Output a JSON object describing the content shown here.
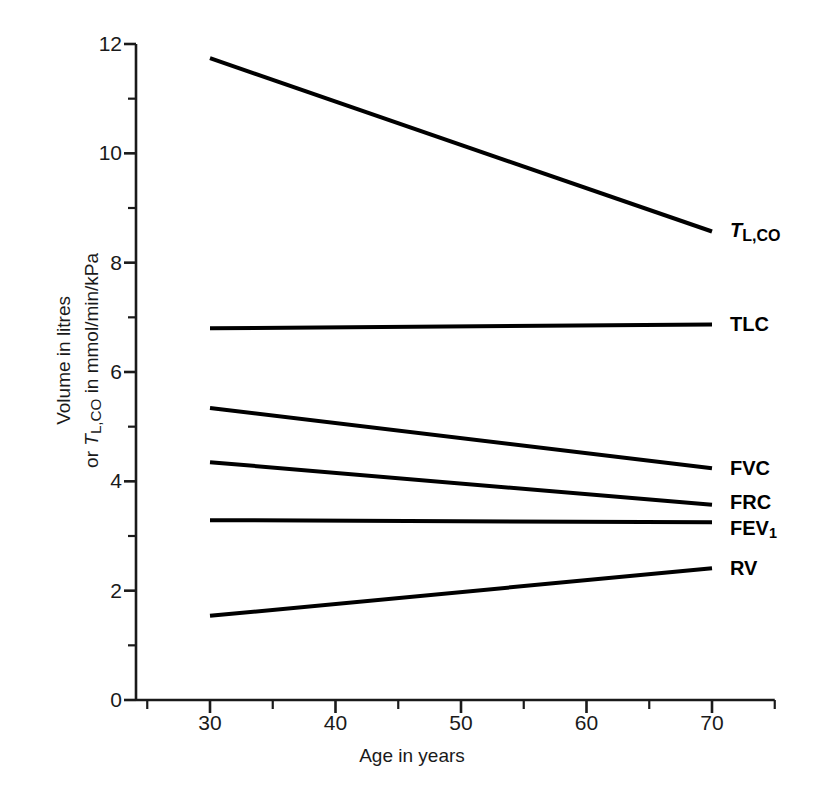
{
  "chart_data": {
    "type": "line",
    "title": "",
    "xlabel": "Age in years",
    "ylabel_line1": "Volume in litres",
    "ylabel_line2_prefix": "or ",
    "ylabel_line2_symbol_main": "T",
    "ylabel_line2_symbol_sub": "L,CO",
    "ylabel_line2_suffix": " in mmol/min/kPa",
    "x": [
      30,
      70
    ],
    "xlim": [
      25,
      75
    ],
    "ylim": [
      0,
      12
    ],
    "xticks_major": [
      30,
      40,
      50,
      60,
      70
    ],
    "xticks_minor": [
      25,
      35,
      45,
      55,
      65,
      75
    ],
    "yticks_major": [
      0,
      2,
      4,
      6,
      8,
      10,
      12
    ],
    "yticks_minor": [
      1,
      3,
      5,
      7,
      9,
      11
    ],
    "xtick_labels": [
      "30",
      "40",
      "50",
      "60",
      "70"
    ],
    "ytick_labels": [
      "0",
      "2",
      "4",
      "6",
      "8",
      "10",
      "12"
    ],
    "grid": false,
    "legend": "right-of-line-ends",
    "series": [
      {
        "name": "T_L,CO",
        "label_main": "T",
        "label_sub": "L,CO",
        "label_style": "bold-italic-smallcaps-sub",
        "values": [
          11.74,
          8.57
        ],
        "label_y": 8.57
      },
      {
        "name": "TLC",
        "label_main": "TLC",
        "label_sub": "",
        "label_style": "bold",
        "values": [
          6.8,
          6.87
        ],
        "label_y": 6.87
      },
      {
        "name": "FVC",
        "label_main": "FVC",
        "label_sub": "",
        "label_style": "bold",
        "values": [
          5.34,
          4.24
        ],
        "label_y": 4.24
      },
      {
        "name": "FRC",
        "label_main": "FRC",
        "label_sub": "",
        "label_style": "bold",
        "values": [
          4.35,
          3.57
        ],
        "label_y": 3.62
      },
      {
        "name": "FEV1",
        "label_main": "FEV",
        "label_sub": "1",
        "label_style": "bold-sub",
        "values": [
          3.29,
          3.25
        ],
        "label_y": 3.12
      },
      {
        "name": "RV",
        "label_main": "RV",
        "label_sub": "",
        "label_style": "bold",
        "values": [
          1.54,
          2.41
        ],
        "label_y": 2.41
      }
    ],
    "line_color": "#000000",
    "axis_color": "#1a1a1a",
    "background": "#ffffff"
  }
}
